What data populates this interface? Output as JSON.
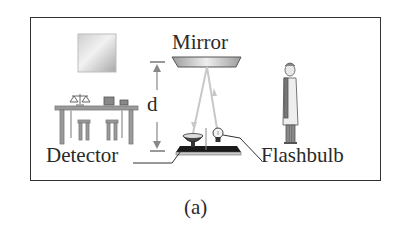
{
  "figure": {
    "caption": "(a)",
    "labels": {
      "mirror": "Mirror",
      "distance": "d",
      "detector": "Detector",
      "flashbulb": "Flashbulb"
    },
    "elements": [
      "wall-picture",
      "lab-table-with-balance",
      "ceiling-mirror",
      "distance-arrow",
      "detector-dish",
      "flashbulb",
      "base-plate",
      "observer-in-lab-coat",
      "light-rays"
    ],
    "colors": {
      "frame": "#333333",
      "text": "#2a2a2a",
      "light_ray": "#c8c8c8",
      "furniture": "#9a9a9a",
      "base_plate": "#1a1a1a"
    }
  }
}
